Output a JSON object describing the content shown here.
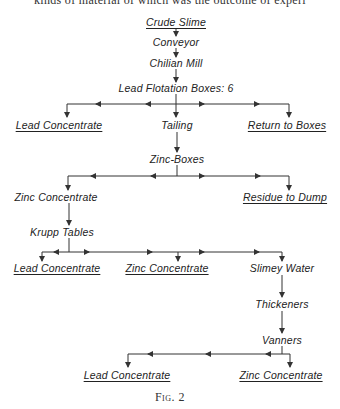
{
  "top_text_fragment": "kinds of material of which was the outcome of experi",
  "nodes": {
    "crude_slime": {
      "label": "Crude Slime",
      "x": 176,
      "y": 22,
      "underline": true
    },
    "conveyor": {
      "label": "Conveyor",
      "x": 176,
      "y": 42
    },
    "chilian_mill": {
      "label": "Chilian  Mill",
      "x": 176,
      "y": 63
    },
    "lead_flotation": {
      "label": "Lead Flotation Boxes: 6",
      "x": 176,
      "y": 88
    },
    "lead_conc_1": {
      "label": "Lead Concentrate",
      "x": 59,
      "y": 125,
      "underline": true
    },
    "tailing": {
      "label": "Tailing",
      "x": 177,
      "y": 125
    },
    "return_boxes": {
      "label": "Return to Boxes",
      "x": 287,
      "y": 125,
      "underline": true
    },
    "zinc_boxes": {
      "label": "Zinc-Boxes",
      "x": 177,
      "y": 159
    },
    "zinc_conc_1": {
      "label": "Zinc Concentrate",
      "x": 56,
      "y": 197
    },
    "residue": {
      "label": "Residue  to Dump",
      "x": 285,
      "y": 197,
      "underline": true
    },
    "krupp": {
      "label": "Krupp Tables",
      "x": 62,
      "y": 232
    },
    "lead_conc_2": {
      "label": "Lead Concentrate",
      "x": 57,
      "y": 268,
      "underline": true
    },
    "zinc_conc_2": {
      "label": "Zinc Concentrate",
      "x": 167,
      "y": 268,
      "underline": true
    },
    "slimey_water": {
      "label": "Slimey Water",
      "x": 282,
      "y": 268
    },
    "thickeners": {
      "label": "Thickeners",
      "x": 282,
      "y": 304
    },
    "vanners": {
      "label": "Vanners",
      "x": 282,
      "y": 340
    },
    "lead_conc_3": {
      "label": "Lead Concentrate",
      "x": 127,
      "y": 375,
      "underline": true
    },
    "zinc_conc_3": {
      "label": "Zinc Concentrate",
      "x": 281,
      "y": 375,
      "underline": true
    }
  },
  "caption": "Fig. 2",
  "line_color": "#333333"
}
